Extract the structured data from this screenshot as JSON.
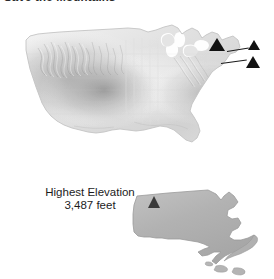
{
  "title": "Save the Mountains",
  "us_map": {
    "name": "united-states-shaded-relief-map",
    "markers": [
      {
        "id": "marker-primary",
        "style": "black-triangle",
        "size": "large"
      },
      {
        "id": "marker-secondary-1",
        "style": "black-triangle",
        "size": "small"
      },
      {
        "id": "marker-secondary-2",
        "style": "black-triangle",
        "size": "small"
      }
    ]
  },
  "legend": {
    "line1": "Highest Elevation",
    "line2": "3,487 feet",
    "marker_icon": "triangle-icon"
  },
  "inset_map": {
    "name": "massachusetts-outline-map",
    "peak_marker_icon": "triangle-icon"
  },
  "colors": {
    "title_text": "#2b2b2b",
    "label_text": "#1c1c1c",
    "marker_black": "#121212",
    "legend_marker_gray": "#5e5e5e",
    "inset_fill": "#b4b4b4",
    "inset_stroke": "#9a9a9a",
    "relief_light": "#f2f2f2",
    "relief_mid": "#d8d8d8",
    "relief_dark": "#a9a9a9",
    "background": "#ffffff"
  }
}
